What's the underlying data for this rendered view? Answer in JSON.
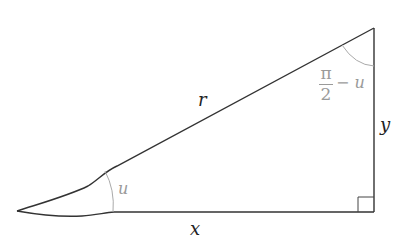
{
  "diagram": {
    "type": "right-triangle",
    "labels": {
      "hypotenuse": "r",
      "horizontal_leg": "x",
      "vertical_leg": "y",
      "angle_bottom_left": "u",
      "angle_top_numerator": "π",
      "angle_top_denominator": "2",
      "angle_top_suffix": "− u"
    },
    "vertices": {
      "left": [
        17,
        211
      ],
      "bottom_right": [
        374,
        212
      ],
      "top": [
        374,
        28
      ]
    },
    "colors": {
      "line": "#333333",
      "arc": "#aaaaaa",
      "angle_label": "#9a9a9a"
    }
  }
}
